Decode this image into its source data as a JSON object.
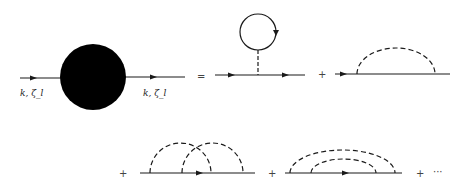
{
  "diagram": {
    "left_label": "k, ζ_l",
    "right_label": "k, ζ_l",
    "equals": "=",
    "plus": "+",
    "ellipsis": "···",
    "terms": [
      {
        "name": "full-propagator",
        "description": "solid line through black blob"
      },
      {
        "name": "tadpole-diagram",
        "description": "solid line with dashed stem to closed fermion loop"
      },
      {
        "name": "rainbow-first-order",
        "description": "solid line with single dashed arc"
      },
      {
        "name": "crossed-second-order",
        "description": "solid line with two crossing dashed arcs"
      },
      {
        "name": "rainbow-second-order",
        "description": "solid line with two nested dashed arcs"
      }
    ],
    "colors": {
      "line": "#1a1a1a",
      "blob": "#000000",
      "background": "#ffffff"
    }
  }
}
